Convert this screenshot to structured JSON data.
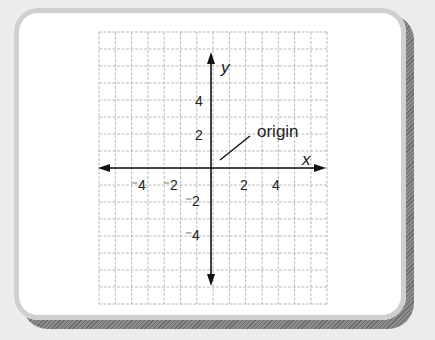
{
  "diagram": {
    "type": "coordinate-plane",
    "axes": {
      "x_label": "x",
      "y_label": "y"
    },
    "x_tick_labels": [
      "⁻4",
      "⁻2",
      "2",
      "4"
    ],
    "y_tick_labels": [
      "4",
      "2",
      "⁻2",
      "⁻4"
    ],
    "annotation": {
      "text": "origin"
    },
    "grid": {
      "columns": 14,
      "rows": 16,
      "style": "dashed"
    },
    "colors": {
      "axis": "#111111",
      "grid": "#a0a0a0",
      "frame_shadow": "#777777"
    }
  }
}
